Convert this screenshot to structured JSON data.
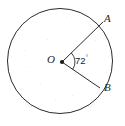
{
  "figure": {
    "type": "geometry-diagram",
    "background_color": "#ffffff",
    "stroke_color": "#2b2b2b",
    "labels": {
      "center": "O",
      "point_a": "A",
      "point_b": "B",
      "angle_value": "72",
      "angle_unit": "°"
    },
    "geometry": {
      "circle": {
        "cx": 60,
        "cy": 61,
        "r": 53
      },
      "center_point": {
        "x": 62,
        "y": 62
      },
      "point_a": {
        "x": 103,
        "y": 22
      },
      "point_b": {
        "x": 100,
        "y": 88
      },
      "angle_degrees": 72,
      "angle_arc_radius": 13
    }
  }
}
